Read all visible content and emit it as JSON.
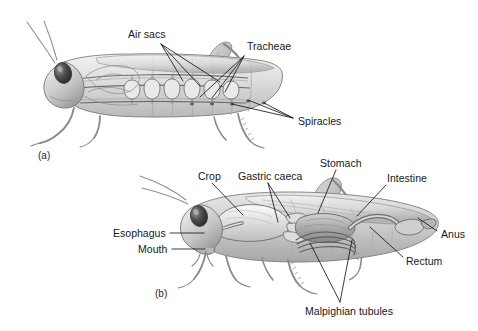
{
  "figure": {
    "background_color": "#ffffff",
    "ink_color": "#16181a",
    "panels": [
      {
        "id": "a",
        "caption": "(a)",
        "subject": "respiratory-system",
        "caption_x": 38,
        "caption_y": 150
      },
      {
        "id": "b",
        "caption": "(b)",
        "subject": "digestive-system",
        "caption_x": 155,
        "caption_y": 288
      }
    ],
    "labels": [
      {
        "name": "air-sacs",
        "text": "Air sacs",
        "panel": "a",
        "x": 128,
        "y": 28,
        "anchor_x": 160,
        "anchor_y": 44,
        "leaders": [
          [
            161,
            44,
            183,
            81
          ],
          [
            161,
            44,
            200,
            86
          ],
          [
            161,
            44,
            220,
            82
          ]
        ]
      },
      {
        "name": "tracheae",
        "text": "Tracheae",
        "panel": "a",
        "x": 247,
        "y": 40,
        "anchor_x": 245,
        "anchor_y": 55,
        "leaders": [
          [
            244,
            56,
            200,
            97
          ],
          [
            244,
            56,
            212,
            98
          ],
          [
            244,
            56,
            225,
            92
          ]
        ]
      },
      {
        "name": "spiracles",
        "text": "Spiracles",
        "panel": "a",
        "x": 298,
        "y": 115,
        "anchor_x": 294,
        "anchor_y": 118,
        "leaders": [
          [
            293,
            118,
            232,
            104
          ],
          [
            293,
            118,
            248,
            100
          ],
          [
            293,
            118,
            264,
            103
          ]
        ]
      },
      {
        "name": "crop",
        "text": "Crop",
        "panel": "b",
        "x": 198,
        "y": 170,
        "anchor_x": 212,
        "anchor_y": 183,
        "leaders": [
          [
            212,
            183,
            243,
            215
          ]
        ]
      },
      {
        "name": "gastric-caeca",
        "text": "Gastric caeca",
        "panel": "b",
        "x": 238,
        "y": 170,
        "anchor_x": 268,
        "anchor_y": 183,
        "leaders": [
          [
            268,
            183,
            278,
            222
          ],
          [
            268,
            183,
            290,
            218
          ]
        ]
      },
      {
        "name": "stomach",
        "text": "Stomach",
        "panel": "b",
        "x": 320,
        "y": 157,
        "anchor_x": 336,
        "anchor_y": 170,
        "leaders": [
          [
            336,
            170,
            318,
            213
          ]
        ]
      },
      {
        "name": "intestine",
        "text": "Intestine",
        "panel": "b",
        "x": 387,
        "y": 172,
        "anchor_x": 386,
        "anchor_y": 185,
        "leaders": [
          [
            386,
            185,
            357,
            216
          ]
        ]
      },
      {
        "name": "anus",
        "text": "Anus",
        "panel": "b",
        "x": 441,
        "y": 228,
        "anchor_x": 438,
        "anchor_y": 231,
        "leaders": [
          [
            437,
            231,
            418,
            218
          ]
        ]
      },
      {
        "name": "rectum",
        "text": "Rectum",
        "panel": "b",
        "x": 406,
        "y": 255,
        "anchor_x": 404,
        "anchor_y": 257,
        "leaders": [
          [
            403,
            257,
            370,
            227
          ]
        ]
      },
      {
        "name": "esophagus",
        "text": "Esophagus",
        "panel": "b",
        "x": 113,
        "y": 227,
        "anchor_x": 170,
        "anchor_y": 233,
        "leaders": [
          [
            170,
            233,
            204,
            233
          ]
        ]
      },
      {
        "name": "mouth",
        "text": "Mouth",
        "panel": "b",
        "x": 138,
        "y": 243,
        "anchor_x": 172,
        "anchor_y": 249,
        "leaders": [
          [
            172,
            249,
            205,
            249
          ]
        ]
      },
      {
        "name": "malpighian-tubules",
        "text": "Malpighian tubules",
        "panel": "b",
        "x": 305,
        "y": 305,
        "anchor_x": 340,
        "anchor_y": 303,
        "leaders": [
          [
            340,
            302,
            310,
            243
          ],
          [
            340,
            302,
            352,
            240
          ]
        ]
      }
    ]
  }
}
